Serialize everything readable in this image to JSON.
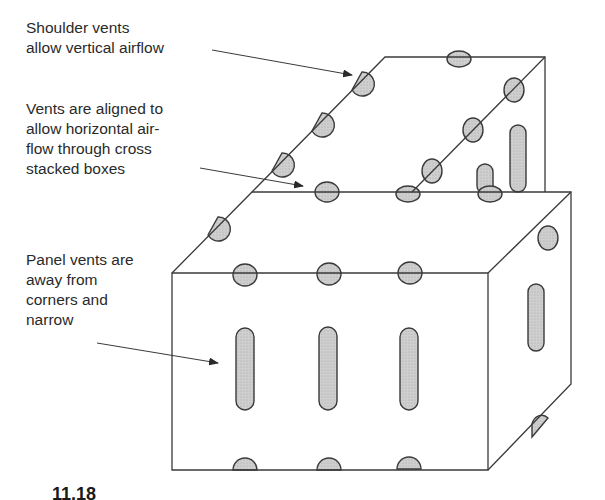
{
  "annotations": [
    {
      "text": "Shoulder vents\nallow vertical airflow"
    },
    {
      "text": "Vents are aligned to\nallow horizontal air-\nflow through cross\nstacked boxes"
    },
    {
      "text": "Panel vents are\naway from\ncorners and\nnarrow"
    }
  ],
  "figure_label": "11.18",
  "colors": {
    "line": "#3a3a3a",
    "vent_fill": "#c8c8c8",
    "text": "#2a2a2a"
  }
}
